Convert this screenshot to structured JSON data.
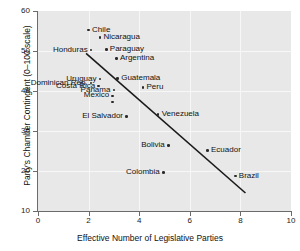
{
  "chart_data": {
    "type": "scatter",
    "title": "",
    "xlabel": "Effective Number of Legislative Parties",
    "ylabel": "Party's Chamber Contingent (0–100 scale)",
    "xlim": [
      0,
      10
    ],
    "ylim": [
      10,
      60
    ],
    "xticks": [
      0,
      2,
      4,
      6,
      8,
      10
    ],
    "yticks": [
      10,
      20,
      30,
      40,
      50,
      60
    ],
    "grid": true,
    "legend": "none",
    "points": [
      {
        "label": "Chile",
        "x": 2.0,
        "y": 55.2,
        "side": "right"
      },
      {
        "label": "Nicaragua",
        "x": 2.45,
        "y": 53.4,
        "side": "right"
      },
      {
        "label": "Paraguay",
        "x": 2.7,
        "y": 50.4,
        "side": "right"
      },
      {
        "label": "Honduras",
        "x": 2.1,
        "y": 50.2,
        "side": "left"
      },
      {
        "label": "Argentina",
        "x": 3.1,
        "y": 48.1,
        "side": "right"
      },
      {
        "label": "Uruguay",
        "x": 2.45,
        "y": 43.0,
        "side": "left"
      },
      {
        "label": "Guatemala",
        "x": 3.15,
        "y": 43.1,
        "side": "right"
      },
      {
        "label": "Dominican Rep.",
        "x": 2.1,
        "y": 42.0,
        "side": "left"
      },
      {
        "label": "Peru",
        "x": 4.15,
        "y": 40.9,
        "side": "right"
      },
      {
        "label": "Costa Rica",
        "x": 2.4,
        "y": 41.2,
        "side": "left"
      },
      {
        "label": "Panama",
        "x": 3.0,
        "y": 40.2,
        "side": "left"
      },
      {
        "label": "Mexico",
        "x": 2.95,
        "y": 38.8,
        "side": "left"
      },
      {
        "label": "",
        "x": 2.95,
        "y": 37.2,
        "side": "right"
      },
      {
        "label": "Venezuela",
        "x": 4.75,
        "y": 34.1,
        "side": "right"
      },
      {
        "label": "El Salvador",
        "x": 3.5,
        "y": 33.6,
        "side": "left"
      },
      {
        "label": "Bolivia",
        "x": 5.15,
        "y": 26.4,
        "side": "left"
      },
      {
        "label": "Ecuador",
        "x": 6.7,
        "y": 25.1,
        "side": "right"
      },
      {
        "label": "Colombia",
        "x": 4.95,
        "y": 19.6,
        "side": "left"
      },
      {
        "label": "Brazil",
        "x": 7.8,
        "y": 18.7,
        "side": "right"
      }
    ],
    "fit_line": {
      "x1": 1.9,
      "y1": 49.4,
      "x2": 8.2,
      "y2": 14.5
    }
  },
  "colors": {
    "panel": "#e8e8e8",
    "grid": "#f7f7f7",
    "marker": "#2a2a2a",
    "fit": "#1a1a1a",
    "axis": "#6b6b6b",
    "text": "#111111"
  }
}
